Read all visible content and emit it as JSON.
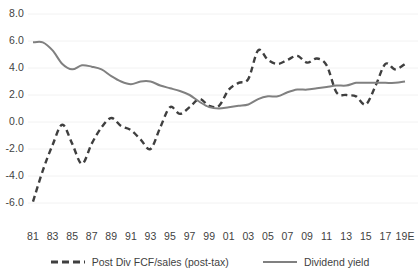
{
  "chart_data": {
    "type": "line",
    "title": "",
    "xlabel": "",
    "ylabel": "",
    "ylim": [
      -6.0,
      8.0
    ],
    "yticks": [
      "8.0",
      "6.0",
      "4.0",
      "2.0",
      "0.0",
      "-2.0",
      "-4.0",
      "-6.0"
    ],
    "ytick_values": [
      8.0,
      6.0,
      4.0,
      2.0,
      0.0,
      -2.0,
      -4.0,
      -6.0
    ],
    "grid": "horizontal-light",
    "legend_position": "bottom",
    "x": [
      1981,
      1982,
      1983,
      1984,
      1985,
      1986,
      1987,
      1988,
      1989,
      1990,
      1991,
      1992,
      1993,
      1994,
      1995,
      1996,
      1997,
      1998,
      1999,
      2000,
      2001,
      2002,
      2003,
      2004,
      2005,
      2006,
      2007,
      2008,
      2009,
      2010,
      2011,
      2012,
      2013,
      2014,
      2015,
      2016,
      2017,
      2018,
      2019
    ],
    "xtick_labels": [
      "81",
      "83",
      "85",
      "87",
      "89",
      "91",
      "93",
      "95",
      "97",
      "99",
      "01",
      "03",
      "05",
      "07",
      "09",
      "11",
      "13",
      "15",
      "17",
      "19E"
    ],
    "xtick_values": [
      1981,
      1983,
      1985,
      1987,
      1989,
      1991,
      1993,
      1995,
      1997,
      1999,
      2001,
      2003,
      2005,
      2007,
      2009,
      2011,
      2013,
      2015,
      2017,
      2019
    ],
    "series": [
      {
        "name": "Post Div FCF/sales (post-tax)",
        "style": "dashed",
        "color": "#3f3f3f",
        "values": [
          -5.9,
          -3.6,
          -1.7,
          -0.2,
          -1.6,
          -3.1,
          -1.6,
          -0.4,
          0.3,
          -0.3,
          -0.6,
          -1.3,
          -2.0,
          -0.4,
          1.1,
          0.6,
          1.1,
          1.7,
          1.2,
          1.2,
          2.4,
          2.9,
          3.2,
          5.3,
          4.6,
          4.3,
          4.6,
          4.9,
          4.4,
          4.7,
          4.2,
          2.2,
          2.0,
          1.9,
          1.3,
          2.7,
          4.3,
          3.9,
          4.3
        ]
      },
      {
        "name": "Dividend yield",
        "style": "solid",
        "color": "#808080",
        "values": [
          5.9,
          5.9,
          5.3,
          4.3,
          3.9,
          4.2,
          4.1,
          3.9,
          3.4,
          3.0,
          2.8,
          3.0,
          3.0,
          2.7,
          2.5,
          2.3,
          2.0,
          1.5,
          1.1,
          1.0,
          1.1,
          1.2,
          1.3,
          1.7,
          1.9,
          1.9,
          2.2,
          2.4,
          2.4,
          2.5,
          2.6,
          2.7,
          2.7,
          2.9,
          2.9,
          2.9,
          2.9,
          2.9,
          3.0
        ]
      }
    ]
  },
  "legend": {
    "entries": [
      {
        "label": "Post Div FCF/sales (post-tax)",
        "style": "dashed",
        "color": "#3f3f3f"
      },
      {
        "label": "Dividend yield",
        "style": "solid",
        "color": "#808080"
      }
    ]
  }
}
